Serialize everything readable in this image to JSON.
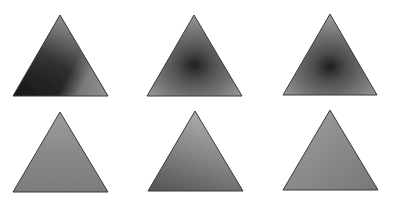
{
  "figure": {
    "width": 393,
    "height": 199,
    "background": "#ffffff",
    "stroke_color": "#3a3a3a",
    "rows": 2,
    "cols": 3
  },
  "triangles": [
    {
      "id": "t1",
      "row": 0,
      "col": 0,
      "apex": [
        60,
        15
      ],
      "base_left": [
        13,
        96
      ],
      "base_right": [
        108,
        96
      ],
      "shading": "dark lower-left, lighter upper/right",
      "colors": {
        "light": "#a0a0a0",
        "mid": "#5a5a5a",
        "dark": "#1e1e1e"
      }
    },
    {
      "id": "t2",
      "row": 0,
      "col": 1,
      "apex": [
        194,
        15
      ],
      "base_left": [
        147,
        96
      ],
      "base_right": [
        242,
        96
      ],
      "shading": "dark center spot",
      "colors": {
        "light": "#9a9a9a",
        "mid": "#6e6e6e",
        "dark": "#2a2a2a"
      }
    },
    {
      "id": "t3",
      "row": 0,
      "col": 2,
      "apex": [
        330,
        14
      ],
      "base_left": [
        283,
        95
      ],
      "base_right": [
        377,
        95
      ],
      "shading": "dark center-lower spot",
      "colors": {
        "light": "#9c9c9c",
        "mid": "#6a6a6a",
        "dark": "#262626"
      }
    },
    {
      "id": "t4",
      "row": 1,
      "col": 0,
      "apex": [
        60,
        112
      ],
      "base_left": [
        13,
        192
      ],
      "base_right": [
        108,
        192
      ],
      "shading": "near-uniform medium gray",
      "colors": {
        "light": "#a8a8a8",
        "mid": "#8a8a8a",
        "dark": "#747474"
      }
    },
    {
      "id": "t5",
      "row": 1,
      "col": 1,
      "apex": [
        195,
        111
      ],
      "base_left": [
        148,
        191
      ],
      "base_right": [
        243,
        191
      ],
      "shading": "lighter top, darker lower-left",
      "colors": {
        "light": "#b0b0b0",
        "mid": "#8c8c8c",
        "dark": "#5e5e5e"
      }
    },
    {
      "id": "t6",
      "row": 1,
      "col": 2,
      "apex": [
        330,
        110
      ],
      "base_left": [
        283,
        190
      ],
      "base_right": [
        378,
        190
      ],
      "shading": "near-uniform medium gray",
      "colors": {
        "light": "#a6a6a6",
        "mid": "#8e8e8e",
        "dark": "#767676"
      }
    }
  ]
}
